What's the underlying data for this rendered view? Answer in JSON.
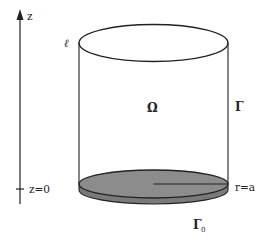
{
  "diagram": {
    "colors": {
      "stroke": "#222222",
      "disk_fill": "#8c8c8c",
      "disk_side": "#7a7a7a",
      "background": "#ffffff"
    },
    "axis": {
      "label_top": "z",
      "label_origin": "z=0"
    },
    "labels": {
      "edge_curve": "ℓ",
      "domain": "Ω",
      "lateral_boundary": "Γ",
      "radius": "r=a",
      "bottom_boundary": "Γ",
      "bottom_boundary_subscript": "0"
    }
  }
}
